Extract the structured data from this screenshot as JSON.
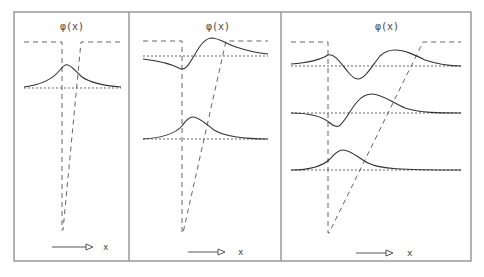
{
  "figure": {
    "panels": [
      {
        "title": "φ(x)",
        "axis_label": "x",
        "states": 1
      },
      {
        "title": "φ(x)",
        "axis_label": "x",
        "states": 2
      },
      {
        "title": "φ(x)",
        "axis_label": "x",
        "states": 3
      }
    ]
  }
}
